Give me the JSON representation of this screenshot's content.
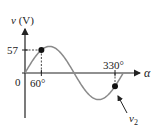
{
  "diagram": {
    "type": "sinusoid",
    "y_axis_label": "v (V)",
    "y_axis_label_italic": "v",
    "y_axis_label_unit": "(V)",
    "x_axis_label": "α",
    "origin_label": "0",
    "marked_value_label": "57",
    "angle_labels": [
      "60°",
      "330°"
    ],
    "point_label_base": "v",
    "point_label_sub": "2",
    "marked_value": 57,
    "amplitude": 65.8,
    "marked_angles_deg": [
      60,
      330
    ],
    "curve_range_deg": [
      0,
      360
    ],
    "colors": {
      "axis": "#222222",
      "curve": "#8a8a8a",
      "point": "#111111",
      "dash": "#333333"
    }
  }
}
